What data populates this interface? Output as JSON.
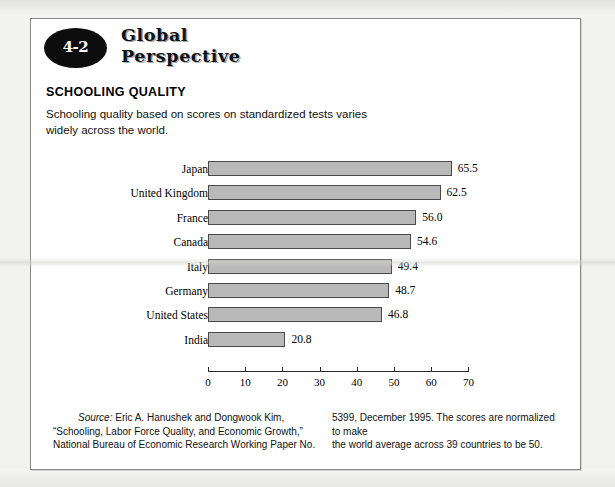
{
  "badge": {
    "number": "4-2"
  },
  "brand": {
    "line1": "Global",
    "line2": "Perspective"
  },
  "section": {
    "title": "SCHOOLING QUALITY",
    "description": "Schooling quality based on scores on standardized tests varies widely across the world."
  },
  "footnote": {
    "source_word": "Source:",
    "left_line1": " Eric A. Hanushek and Dongwook Kim,",
    "left_line2": "“Schooling, Labor Force Quality, and Economic Growth,”",
    "left_line3": "National Bureau of Economic Research Working Paper No.",
    "right_line1": "5399, December 1995. The scores are normalized to make",
    "right_line2": "the world average across 39 countries to be 50."
  },
  "chart_data": {
    "type": "bar",
    "orientation": "horizontal",
    "title": "SCHOOLING QUALITY",
    "subtitle": "Schooling quality based on scores on standardized tests varies widely across the world.",
    "xlabel": "",
    "ylabel": "",
    "xlim": [
      0,
      70
    ],
    "xticks": [
      0,
      10,
      20,
      30,
      40,
      50,
      60,
      70
    ],
    "xtick_labels": [
      "0",
      "10",
      "20",
      "30",
      "40",
      "50",
      "60",
      "70"
    ],
    "grid": false,
    "legend": false,
    "categories": [
      "Japan",
      "United Kingdom",
      "France",
      "Canada",
      "Italy",
      "Germany",
      "United States",
      "India"
    ],
    "values": [
      65.5,
      62.5,
      56.0,
      54.6,
      49.4,
      48.7,
      46.8,
      20.8
    ],
    "value_labels": [
      "65.5",
      "62.5",
      "56.0",
      "54.6",
      "49.4",
      "48.7",
      "46.8",
      "20.8"
    ],
    "bar_color": "#b9b9b9",
    "bar_border_color": "#4a4a4a"
  }
}
